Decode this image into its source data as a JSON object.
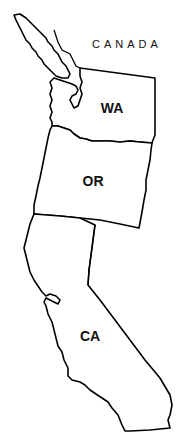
{
  "map": {
    "title": "",
    "labels": {
      "country": "CANADA",
      "states": [
        {
          "abbr": "WA",
          "name": "Washington"
        },
        {
          "abbr": "OR",
          "name": "Oregon"
        },
        {
          "abbr": "CA",
          "name": "California"
        }
      ]
    },
    "colors": {
      "outline": "#000000",
      "fill": "#ffffff",
      "text": "#111111"
    }
  }
}
